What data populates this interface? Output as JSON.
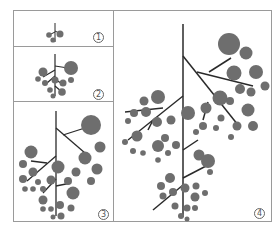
{
  "figure": {
    "panels": [
      {
        "id": 1,
        "label": "1",
        "label_glyph": "①",
        "stage": "small seedling-like branching"
      },
      {
        "id": 2,
        "label": "2",
        "label_glyph": "②",
        "stage": "early branching"
      },
      {
        "id": 3,
        "label": "3",
        "label_glyph": "③",
        "stage": "intermediate branching"
      },
      {
        "id": 4,
        "label": "4",
        "label_glyph": "④",
        "stage": "fully branched"
      }
    ],
    "colors": {
      "node_fill": "#6e6e6e",
      "branch_stroke": "#2a2a2a",
      "border": "#9a9a9a"
    }
  }
}
